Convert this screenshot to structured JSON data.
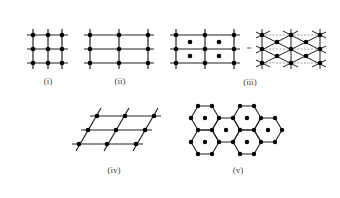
{
  "figure": {
    "panels": [
      {
        "id": "i",
        "label": "(i)",
        "type": "square"
      },
      {
        "id": "ii",
        "label": "(ii)",
        "type": "rectangular"
      },
      {
        "id": "iii",
        "label": "(iii)",
        "type": "centered rectangular",
        "equals_sign": "="
      },
      {
        "id": "iv",
        "label": "(iv)",
        "type": "oblique"
      },
      {
        "id": "v",
        "label": "(v)",
        "type": "hexagonal"
      }
    ]
  },
  "colors": {
    "line": "#222222",
    "dot": "#000000",
    "dashed": "#888888",
    "label": "#444444"
  }
}
